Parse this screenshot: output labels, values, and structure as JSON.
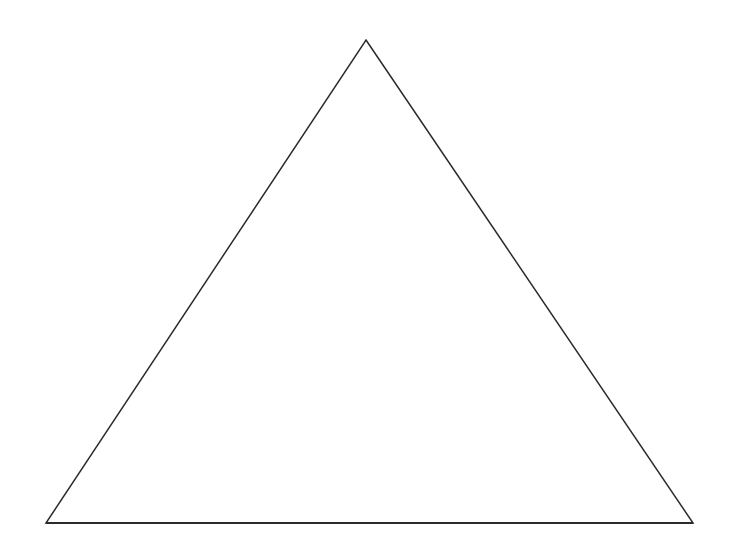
{
  "canvas": {
    "width": 734,
    "height": 557,
    "background_color": "#ffffff",
    "medium": "scanned line drawing"
  },
  "figure": {
    "name": "triangle",
    "kind": "outline",
    "fill": "none",
    "stroke_color": "#2b2b2b",
    "stroke_width": 1.5,
    "baseline_stroke_width": 1.9,
    "vertices": [
      {
        "label": "apex",
        "x": 366,
        "y": 40
      },
      {
        "label": "bottom-right",
        "x": 693,
        "y": 523
      },
      {
        "label": "bottom-left",
        "x": 46,
        "y": 523
      }
    ],
    "points_attr": "366,40 693,523 46,523",
    "baseline": {
      "x1": 46,
      "y1": 523,
      "x2": 693,
      "y2": 523
    },
    "base_width": 647,
    "height": 483
  },
  "chart_data": {
    "type": "scatter",
    "title": "",
    "subtitle": "",
    "xlabel": "",
    "ylabel": "",
    "grid": false,
    "legend": "none",
    "xlim": [
      0,
      734
    ],
    "ylim": [
      0,
      557
    ],
    "annotations": [],
    "series": [
      {
        "name": "triangle-outline",
        "closed": true,
        "x": [
          366,
          693,
          46
        ],
        "y": [
          40,
          523,
          523
        ]
      }
    ]
  }
}
